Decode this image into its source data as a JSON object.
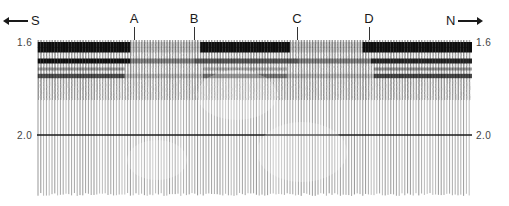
{
  "figure": {
    "direction_left": {
      "label": "S",
      "arrow": "arrow-left"
    },
    "direction_right": {
      "label": "N",
      "arrow": "arrow-right"
    },
    "markers": [
      {
        "label": "A",
        "x": 134
      },
      {
        "label": "B",
        "x": 194
      },
      {
        "label": "C",
        "x": 297
      },
      {
        "label": "D",
        "x": 369
      }
    ],
    "time_axis": {
      "ticks": [
        {
          "label": "1.6",
          "y": 42
        },
        {
          "label": "2.0",
          "y": 135
        }
      ],
      "unit": "seconds (two-way time)"
    },
    "colors": {
      "ink": "#1a1a1a",
      "trace": "#5a5a5a",
      "reflector": "#0d0d0d",
      "background": "#ffffff"
    }
  },
  "chart_data": {
    "type": "heatmap",
    "title": "",
    "xlabel": "",
    "ylabel": "Time (s)",
    "x_direction": {
      "left": "S",
      "right": "N"
    },
    "ylim": [
      1.6,
      2.17
    ],
    "y_ticks": [
      "1.6",
      "2.0"
    ],
    "annotations": [
      "A",
      "B",
      "C",
      "D"
    ],
    "reflectors": [
      {
        "name": "top doublet",
        "time": 1.61,
        "segments": [
          [
            "S",
            "A"
          ],
          [
            "B",
            "C"
          ],
          [
            "D",
            "N"
          ]
        ],
        "strength": "strong"
      },
      {
        "name": "second",
        "time": 1.67,
        "segments": [
          [
            "S",
            "A"
          ],
          [
            "A",
            "B"
          ],
          [
            "B",
            "N"
          ]
        ],
        "strength": "strong"
      },
      {
        "name": "third",
        "time": 1.73,
        "segments": [
          [
            "S",
            "A"
          ],
          [
            "B",
            "C"
          ],
          [
            "D",
            "N"
          ]
        ],
        "strength": "moderate"
      }
    ],
    "horizontal_line_at": 2.0,
    "grid": false,
    "legend": "none"
  }
}
